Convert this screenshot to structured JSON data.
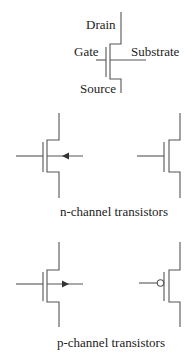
{
  "diagram": {
    "generic_symbol": {
      "terminals": {
        "drain": "Drain",
        "gate": "Gate",
        "substrate": "Substrate",
        "source": "Source"
      }
    },
    "groups": [
      {
        "caption": "n-channel transistors",
        "symbols": [
          {
            "variant": "with-substrate",
            "arrow": "inward"
          },
          {
            "variant": "simplified",
            "arrow": "none"
          }
        ]
      },
      {
        "caption": "p-channel transistors",
        "symbols": [
          {
            "variant": "with-substrate",
            "arrow": "outward"
          },
          {
            "variant": "simplified",
            "gate_marker": "bubble"
          }
        ]
      }
    ],
    "colors": {
      "line": "#555555",
      "text": "#222222",
      "background": "#ffffff"
    }
  }
}
